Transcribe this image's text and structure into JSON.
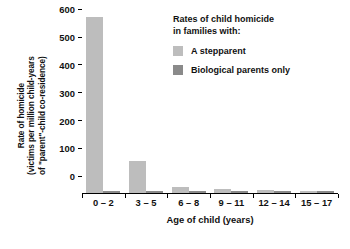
{
  "chart_data": {
    "type": "bar",
    "title": "",
    "categories": [
      "0 – 2",
      "3 – 5",
      "6 – 8",
      "9 – 11",
      "12 – 14",
      "15 – 17"
    ],
    "series": [
      {
        "name": "A stepparent",
        "color": "#bdbdbd",
        "values": [
          633,
          115,
          21,
          15,
          10,
          6
        ]
      },
      {
        "name": "Biological parents only",
        "color": "#8a8a8a",
        "values": [
          8,
          5,
          3,
          2,
          2,
          1
        ]
      }
    ],
    "xlabel": "Age of child (years)",
    "ylabel": "Rate of homicide (victims per million child-years of \"parent\"-child co-residence)",
    "ylabel_lines": [
      "Rate of homicide",
      "(victims per million child-years",
      "of \"parent\"-child co-residence)"
    ],
    "ylim": [
      0,
      650
    ],
    "yticks": [
      0,
      100,
      200,
      300,
      400,
      500,
      600
    ],
    "ytick_labels": [
      "0",
      "100",
      "200",
      "300",
      "400",
      "500",
      "600"
    ],
    "grid": false,
    "legend_position": "top-right"
  },
  "legend": {
    "title_line1": "Rates of child homicide",
    "title_line2": "in families with:",
    "items": [
      {
        "label": "A stepparent",
        "color": "#bdbdbd"
      },
      {
        "label": "Biological parents only",
        "color": "#8a8a8a"
      }
    ]
  }
}
